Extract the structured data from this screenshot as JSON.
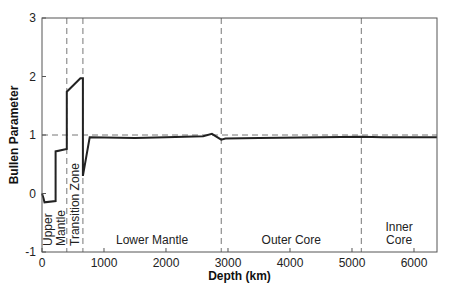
{
  "chart_data": {
    "type": "line",
    "title": "",
    "xlabel": "Depth (km)",
    "ylabel": "Bullen Parameter",
    "xlim": [
      0,
      6371
    ],
    "ylim": [
      -1,
      3
    ],
    "xticks": [
      0,
      1000,
      2000,
      3000,
      4000,
      5000,
      6000
    ],
    "yticks": [
      -1,
      0,
      1,
      2,
      3
    ],
    "grid": false,
    "legend": null,
    "reference_line": {
      "y": 1,
      "style": "dashed"
    },
    "boundaries": [
      {
        "x": 400,
        "style": "dashed"
      },
      {
        "x": 660,
        "style": "dashed"
      },
      {
        "x": 2891,
        "style": "dashed"
      },
      {
        "x": 5150,
        "style": "dashed"
      }
    ],
    "regions": [
      {
        "label_lines": [
          "Upper",
          "Mantle"
        ],
        "orientation": "vertical",
        "x_center": 200
      },
      {
        "label_lines": [
          "Transition Zone"
        ],
        "orientation": "vertical",
        "x_center": 530
      },
      {
        "label_lines": [
          "Lower Mantle"
        ],
        "orientation": "horizontal",
        "x_center": 1775
      },
      {
        "label_lines": [
          "Outer Core"
        ],
        "orientation": "horizontal",
        "x_center": 4020
      },
      {
        "label_lines": [
          "Inner",
          "Core"
        ],
        "orientation": "horizontal",
        "x_center": 5760
      }
    ],
    "series": [
      {
        "name": "Bullen Parameter",
        "x": [
          0,
          24,
          40,
          220,
          220,
          400,
          400,
          620,
          660,
          660,
          770,
          1500,
          2000,
          2600,
          2740,
          2891,
          2960,
          3500,
          4500,
          5150,
          5500,
          6371
        ],
        "values": [
          0.0,
          -0.08,
          -0.15,
          -0.13,
          0.72,
          0.76,
          1.74,
          1.97,
          1.97,
          0.3,
          0.96,
          0.95,
          0.96,
          0.98,
          1.02,
          0.92,
          0.94,
          0.95,
          0.96,
          0.97,
          0.96,
          0.96
        ]
      }
    ]
  },
  "axes": {
    "xlabel": "Depth (km)",
    "ylabel": "Bullen Parameter",
    "xtick_labels": [
      "0",
      "1000",
      "2000",
      "3000",
      "4000",
      "5000",
      "6000"
    ],
    "ytick_labels": [
      "-1",
      "0",
      "1",
      "2",
      "3"
    ]
  }
}
